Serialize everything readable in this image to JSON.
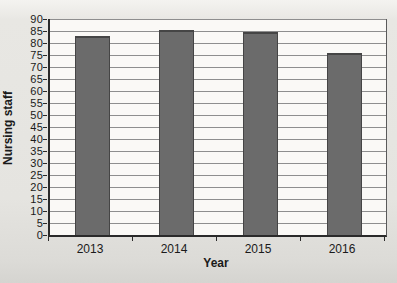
{
  "chart_data": {
    "type": "bar",
    "title": "",
    "categories": [
      "2013",
      "2014",
      "2015",
      "2016"
    ],
    "values": [
      83,
      85.5,
      84.5,
      76
    ],
    "xlabel": "Year",
    "ylabel": "Nursing staff",
    "ylim": [
      0,
      90
    ],
    "ytick_step": 5,
    "yticks": [
      0,
      5,
      10,
      15,
      20,
      25,
      30,
      35,
      40,
      45,
      50,
      55,
      60,
      65,
      70,
      75,
      80,
      85,
      90
    ],
    "grid": "horizontal",
    "legend": "none",
    "colors": {
      "bar_fill": "#6b6b6b",
      "bar_border": "#454545",
      "gridline": "#8e8e8e",
      "axis": "#2a2a2a",
      "plot_border_right": "#5a5a5a",
      "plot_background": "#faf9f6",
      "page_background": "#e5e4e0",
      "text": "#1a1a1a"
    }
  }
}
